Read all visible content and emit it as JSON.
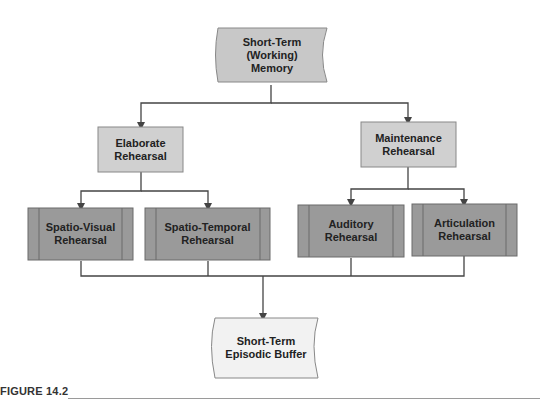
{
  "diagram": {
    "colors": {
      "root_fill": "#c8c8c8",
      "mid_fill": "#d0d0d0",
      "leaf_fill": "#9a9a9a",
      "output_fill": "#f2f2f2",
      "line": "#444444"
    },
    "nodes": {
      "root": {
        "label": "Short-Term\n(Working)\nMemory",
        "shape": "document"
      },
      "elaborate": {
        "label": "Elaborate\nRehearsal",
        "shape": "rectangle"
      },
      "maintenance": {
        "label": "Maintenance\nRehearsal",
        "shape": "rectangle"
      },
      "spatio_visual": {
        "label": "Spatio-Visual\nRehearsal",
        "shape": "predefined-process"
      },
      "spatio_temporal": {
        "label": "Spatio-Temporal\nRehearsal",
        "shape": "predefined-process"
      },
      "auditory": {
        "label": "Auditory\nRehearsal",
        "shape": "predefined-process"
      },
      "articulation": {
        "label": "Articulation\nRehearsal",
        "shape": "predefined-process"
      },
      "buffer": {
        "label": "Short-Term\nEpisodic Buffer",
        "shape": "document"
      }
    },
    "edges": [
      [
        "root",
        "elaborate"
      ],
      [
        "root",
        "maintenance"
      ],
      [
        "elaborate",
        "spatio_visual"
      ],
      [
        "elaborate",
        "spatio_temporal"
      ],
      [
        "maintenance",
        "auditory"
      ],
      [
        "maintenance",
        "articulation"
      ],
      [
        "spatio_visual",
        "buffer"
      ],
      [
        "spatio_temporal",
        "buffer"
      ],
      [
        "auditory",
        "buffer"
      ],
      [
        "articulation",
        "buffer"
      ]
    ]
  },
  "caption": "FIGURE 14.2"
}
